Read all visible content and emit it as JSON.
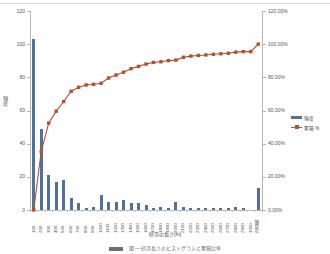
{
  "chart_data": {
    "type": "bar",
    "title": "",
    "subtitle": "",
    "xlabel": "砂浜の長さ(m)",
    "ylabel": "頻度",
    "y2label": "",
    "grid": false,
    "legend_position": "right",
    "ylim": [
      0,
      120
    ],
    "y2lim": [
      0,
      120
    ],
    "yticks": [
      "0",
      "20",
      "40",
      "60",
      "80",
      "100",
      "120"
    ],
    "y2ticks": [
      "0.00%",
      "20.00%",
      "40.00%",
      "60.00%",
      "80.00%",
      "100.00%",
      "120.00%"
    ],
    "categories": [
      "100",
      "200",
      "300",
      "400",
      "500",
      "600",
      "700",
      "800",
      "900",
      "1000",
      "1100",
      "1200",
      "1300",
      "1400",
      "1500",
      "1600",
      "1700",
      "1800",
      "1900",
      "2000",
      "2100",
      "2200",
      "2300",
      "2400",
      "2500",
      "2600",
      "2700",
      "2800",
      "2900",
      "3000",
      "次の級"
    ],
    "series": [
      {
        "name": "頻度",
        "type": "bar",
        "color": "#4f719f",
        "axis": "left",
        "values": [
          103,
          49,
          21,
          17,
          18,
          7,
          4,
          1,
          2,
          9,
          5,
          5,
          6,
          4,
          4,
          3,
          1,
          2,
          1,
          5,
          2,
          1,
          1,
          1,
          1,
          1,
          1,
          2,
          1,
          0,
          13
        ]
      },
      {
        "name": "累積 %",
        "type": "line",
        "color": "#b4502d",
        "axis": "right",
        "values": [
          0.0,
          35.4,
          52.4,
          59.6,
          65.4,
          71.6,
          74.0,
          75.4,
          75.8,
          76.4,
          79.6,
          81.4,
          83.1,
          85.2,
          86.6,
          88.0,
          89.0,
          89.4,
          90.1,
          90.4,
          92.1,
          92.8,
          93.2,
          93.5,
          93.9,
          94.2,
          94.5,
          95.2,
          95.5,
          95.5,
          100.0
        ]
      }
    ]
  },
  "legend": {
    "items": [
      {
        "label": "頻度",
        "key": "bar-key",
        "color": "#4f719f"
      },
      {
        "label": "累積 %",
        "key": "line-key",
        "color": "#b4502d"
      }
    ]
  },
  "caption": {
    "text": "図  — 砂浜長さのヒストグラムと累積比率"
  }
}
